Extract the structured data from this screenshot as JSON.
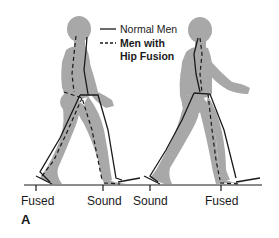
{
  "legend": {
    "items": [
      {
        "style": "solid",
        "label": "Normal Men"
      },
      {
        "style": "dashed",
        "label_line1": "Men with",
        "label_line2": "Hip Fusion"
      }
    ]
  },
  "figures": [
    {
      "id": "left",
      "foot_labels": [
        "Fused",
        "Sound"
      ]
    },
    {
      "id": "right",
      "foot_labels": [
        "Sound",
        "Fused"
      ]
    }
  ],
  "ground_labels": [
    "Fused",
    "Sound",
    "Sound",
    "Fused"
  ],
  "panel_label": "A",
  "colors": {
    "body": "#a6a6a6",
    "line": "#1a1a1a",
    "background": "#ffffff"
  }
}
